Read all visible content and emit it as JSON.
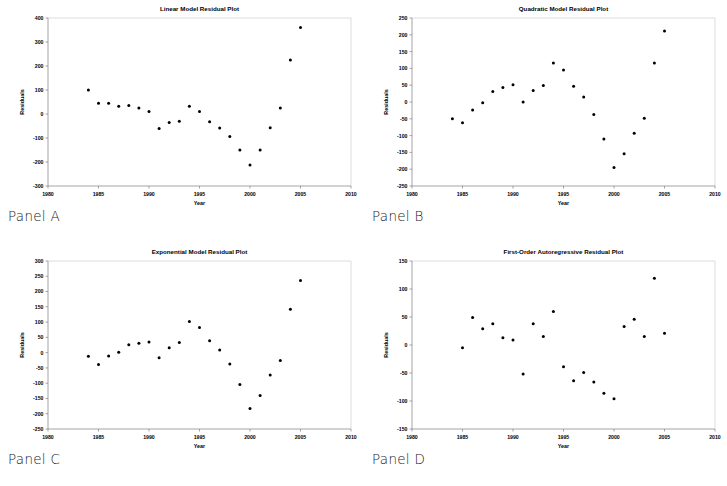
{
  "figure": {
    "background_color": "#ffffff",
    "marker_color": "#000000",
    "axis_color": "#808080",
    "frame_color": "#c8c8c8"
  },
  "panels": [
    {
      "caption": "Panel A",
      "chart_data": {
        "type": "scatter",
        "title": "Linear Model Residual Plot",
        "xlabel": "Year",
        "ylabel": "Residuals",
        "xlim": [
          1980,
          2010
        ],
        "ylim": [
          -300,
          400
        ],
        "xticks": [
          1980,
          1985,
          1990,
          1995,
          2000,
          2005,
          2010
        ],
        "yticks": [
          -300,
          -200,
          -100,
          0,
          100,
          200,
          300,
          400
        ],
        "grid": false,
        "legend": "none",
        "x": [
          1984,
          1985,
          1986,
          1987,
          1988,
          1989,
          1990,
          1991,
          1992,
          1993,
          1994,
          1995,
          1996,
          1997,
          1998,
          1999,
          2000,
          2001,
          2002,
          2003,
          2004,
          2005
        ],
        "values": [
          100,
          45,
          45,
          32,
          35,
          25,
          10,
          -60,
          -35,
          -30,
          32,
          10,
          -32,
          -58,
          -94,
          -150,
          -213,
          -150,
          -57,
          25,
          225,
          360
        ]
      }
    },
    {
      "caption": "Panel B",
      "chart_data": {
        "type": "scatter",
        "title": "Quadratic Model Residual Plot",
        "xlabel": "Year",
        "ylabel": "Residuals",
        "xlim": [
          1980,
          2010
        ],
        "ylim": [
          -250,
          250
        ],
        "xticks": [
          1980,
          1985,
          1990,
          1995,
          2000,
          2005,
          2010
        ],
        "yticks": [
          -250,
          -200,
          -150,
          -100,
          -50,
          0,
          50,
          100,
          150,
          200,
          250
        ],
        "grid": false,
        "legend": "none",
        "x": [
          1984,
          1985,
          1986,
          1987,
          1988,
          1989,
          1990,
          1991,
          1992,
          1993,
          1994,
          1995,
          1996,
          1997,
          1998,
          1999,
          2000,
          2001,
          2002,
          2003,
          2004,
          2005
        ],
        "values": [
          -50,
          -62,
          -24,
          -2,
          31,
          43,
          51,
          0,
          34,
          49,
          116,
          95,
          47,
          15,
          -37,
          -110,
          -195,
          -154,
          -93,
          -48,
          116,
          211
        ]
      }
    },
    {
      "caption": "Panel C",
      "chart_data": {
        "type": "scatter",
        "title": "Exponential Model Residual Plot",
        "xlabel": "Year",
        "ylabel": "Residuals",
        "xlim": [
          1980,
          2010
        ],
        "ylim": [
          -250,
          300
        ],
        "xticks": [
          1980,
          1985,
          1990,
          1995,
          2000,
          2005,
          2010
        ],
        "yticks": [
          -250,
          -200,
          -150,
          -100,
          -50,
          0,
          50,
          100,
          150,
          200,
          250,
          300
        ],
        "grid": false,
        "legend": "none",
        "x": [
          1984,
          1985,
          1986,
          1987,
          1988,
          1989,
          1990,
          1991,
          1992,
          1993,
          1994,
          1995,
          1996,
          1997,
          1998,
          1999,
          2000,
          2001,
          2002,
          2003,
          2004,
          2005
        ],
        "values": [
          -12,
          -39,
          -11,
          1,
          26,
          31,
          35,
          -17,
          16,
          33,
          102,
          82,
          39,
          9,
          -37,
          -104,
          -183,
          -140,
          -73,
          -26,
          142,
          236
        ]
      }
    },
    {
      "caption": "Panel D",
      "chart_data": {
        "type": "scatter",
        "title": "First-Order Autoregressive Residual Plot",
        "xlabel": "Year",
        "ylabel": "Residuals",
        "xlim": [
          1980,
          2010
        ],
        "ylim": [
          -150,
          150
        ],
        "xticks": [
          1980,
          1985,
          1990,
          1995,
          2000,
          2005,
          2010
        ],
        "yticks": [
          -150,
          -100,
          -50,
          0,
          50,
          100,
          150
        ],
        "grid": false,
        "legend": "none",
        "x": [
          1985,
          1986,
          1987,
          1988,
          1989,
          1990,
          1991,
          1992,
          1993,
          1994,
          1995,
          1996,
          1997,
          1998,
          1999,
          2000,
          2001,
          2002,
          2003,
          2004,
          2005
        ],
        "values": [
          -5,
          49,
          29,
          38,
          13,
          9,
          -52,
          38,
          15,
          60,
          -39,
          -64,
          -49,
          -66,
          -86,
          -96,
          33,
          46,
          15,
          119,
          21
        ]
      }
    }
  ]
}
